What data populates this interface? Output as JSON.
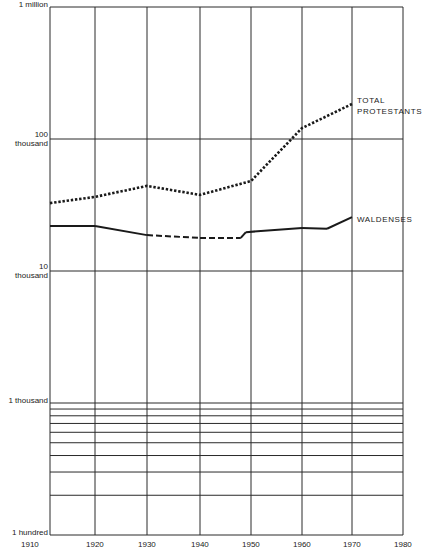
{
  "chart_data": {
    "type": "line",
    "title": "",
    "xlabel": "",
    "ylabel": "",
    "yscale": "log",
    "ylim": [
      100,
      1000000
    ],
    "xlim": [
      1910,
      1983
    ],
    "grid": true,
    "y_tick_labels": [
      {
        "value": 1000000,
        "label_top": "1 million",
        "label_bottom": ""
      },
      {
        "value": 100000,
        "label_top": "100",
        "label_bottom": "thousand"
      },
      {
        "value": 10000,
        "label_top": "10",
        "label_bottom": "thousand"
      },
      {
        "value": 1000,
        "label_top": "1 thousand",
        "label_bottom": ""
      },
      {
        "value": 100,
        "label_top": "1 hundred",
        "label_bottom": ""
      }
    ],
    "x_tick_labels": [
      "1910",
      "1920",
      "1930",
      "1940",
      "1950",
      "1960",
      "1970",
      "1980"
    ],
    "series": [
      {
        "name": "TOTAL PROTESTANTS",
        "label_lines": [
          "TOTAL",
          "PROTESTANTS"
        ],
        "style": "dotted",
        "x": [
          1911,
          1921,
          1931,
          1941,
          1951,
          1961,
          1971
        ],
        "values": [
          32700,
          36400,
          44100,
          37700,
          48100,
          121000,
          184000
        ]
      },
      {
        "name": "WALDENSES",
        "label_lines": [
          "WALDENSES"
        ],
        "style": "solid with dashed segment 1931-1949",
        "x": [
          1911,
          1921,
          1931,
          1941,
          1949,
          1950,
          1961,
          1966,
          1971
        ],
        "values": [
          21900,
          21900,
          18700,
          17800,
          17800,
          19700,
          21200,
          20900,
          25600
        ],
        "dashed_range": [
          1931,
          1949
        ]
      }
    ]
  }
}
